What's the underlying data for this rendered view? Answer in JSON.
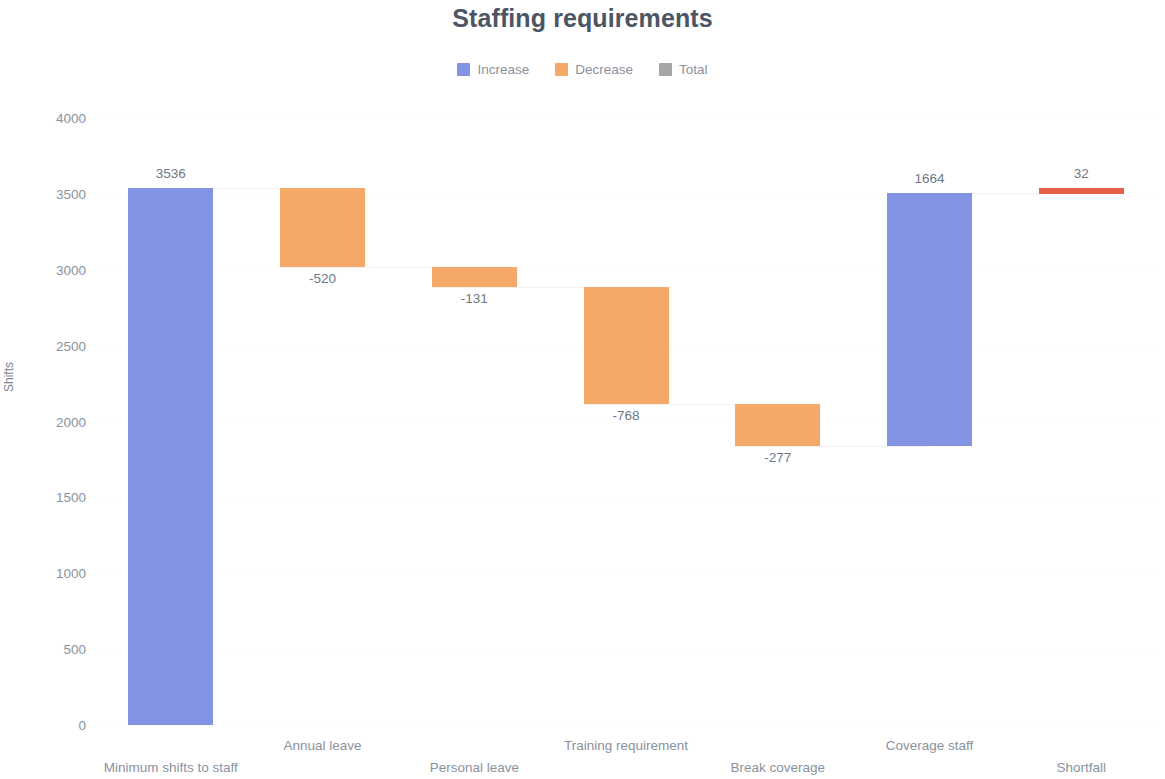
{
  "chart_data": {
    "type": "bar",
    "subtype": "waterfall",
    "title": "Staffing requirements",
    "xlabel": "",
    "ylabel": "Shifts",
    "ylim": [
      0,
      4000
    ],
    "ytick_step": 500,
    "ytick_labels": [
      "4000",
      "3500",
      "3000",
      "2500",
      "2000",
      "1500",
      "1000",
      "500",
      "0"
    ],
    "ytick_values": [
      4000,
      3500,
      3000,
      2500,
      2000,
      1500,
      1000,
      500,
      0
    ],
    "grid": false,
    "legend_position": "top-center",
    "legend": [
      {
        "label": "Increase",
        "color": "#8494e4"
      },
      {
        "label": "Decrease",
        "color": "#f5a968"
      },
      {
        "label": "Total",
        "color": "#a6a6a6"
      }
    ],
    "categories": [
      "Minimum shifts to staff",
      "Annual leave",
      "Personal leave",
      "Training requirement",
      "Break coverage",
      "Coverage staff",
      "Shortfall"
    ],
    "values": [
      3536,
      -520,
      -131,
      -768,
      -277,
      1664,
      32
    ],
    "data_labels": [
      "3536",
      "-520",
      "-131",
      "-768",
      "-277",
      "1664",
      "32"
    ],
    "cumulative_start": [
      0,
      3536,
      3016,
      2885,
      2117,
      1840,
      3504
    ],
    "cumulative_end": [
      3536,
      3016,
      2885,
      2117,
      1840,
      3504,
      3536
    ],
    "bar_types": [
      "increase",
      "decrease",
      "decrease",
      "decrease",
      "decrease",
      "increase",
      "total"
    ],
    "bar_colors": [
      "#8494e4",
      "#f5a968",
      "#f5a968",
      "#f5a968",
      "#f5a968",
      "#8494e4",
      "#e8604c"
    ]
  }
}
